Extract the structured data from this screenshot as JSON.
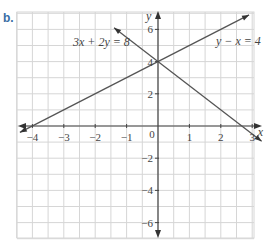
{
  "panel_label": "b.",
  "chart_data": {
    "type": "line",
    "title": "",
    "xlabel": "x",
    "ylabel": "y",
    "xlim": [
      -4.5,
      3.3
    ],
    "ylim": [
      -7,
      7
    ],
    "grid": true,
    "x_ticks": [
      -4,
      -3,
      -2,
      -1,
      0,
      1,
      2,
      3
    ],
    "y_ticks": [
      -6,
      -4,
      -2,
      2,
      4,
      6
    ],
    "origin_label": "0",
    "series": [
      {
        "name": "3x + 2y = 8",
        "equation": "y = 4 - 1.5x",
        "points": [
          [
            -1.4,
            6.1
          ],
          [
            3.3,
            -0.95
          ]
        ]
      },
      {
        "name": "y − x = 4",
        "equation": "y = x + 4",
        "points": [
          [
            -4.4,
            -0.4
          ],
          [
            2.9,
            6.9
          ]
        ]
      }
    ],
    "intersection": [
      0,
      4
    ],
    "annotations": [
      "3x + 2y = 8",
      "y − x = 4"
    ]
  }
}
